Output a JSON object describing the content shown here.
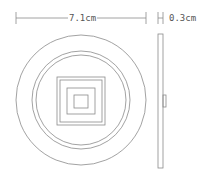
{
  "diagram": {
    "views": [
      "front-view",
      "side-view"
    ],
    "dimensions": {
      "diameter": {
        "label": "7.1cm",
        "value": 7.1,
        "unit": "cm"
      },
      "thickness": {
        "label": "0.3cm",
        "value": 0.3,
        "unit": "cm"
      }
    },
    "front_view": {
      "center": [
        81,
        100
      ],
      "circles_radius_px": [
        65,
        49,
        45
      ],
      "squares": [
        {
          "x": 57,
          "y": 77,
          "w": 48,
          "h": 48
        },
        {
          "x": 60,
          "y": 80,
          "w": 42,
          "h": 42
        },
        {
          "x": 67,
          "y": 88,
          "w": 28,
          "h": 26
        },
        {
          "x": 74,
          "y": 95,
          "w": 14,
          "h": 13
        }
      ]
    },
    "side_view": {
      "body": {
        "x": 158,
        "y": 34,
        "w": 5,
        "h": 134
      },
      "tab": {
        "x": 163,
        "y": 95,
        "w": 3,
        "h": 12
      }
    },
    "colors": {
      "line": "#8a8a8a",
      "text": "#555555",
      "background": "#ffffff"
    }
  }
}
